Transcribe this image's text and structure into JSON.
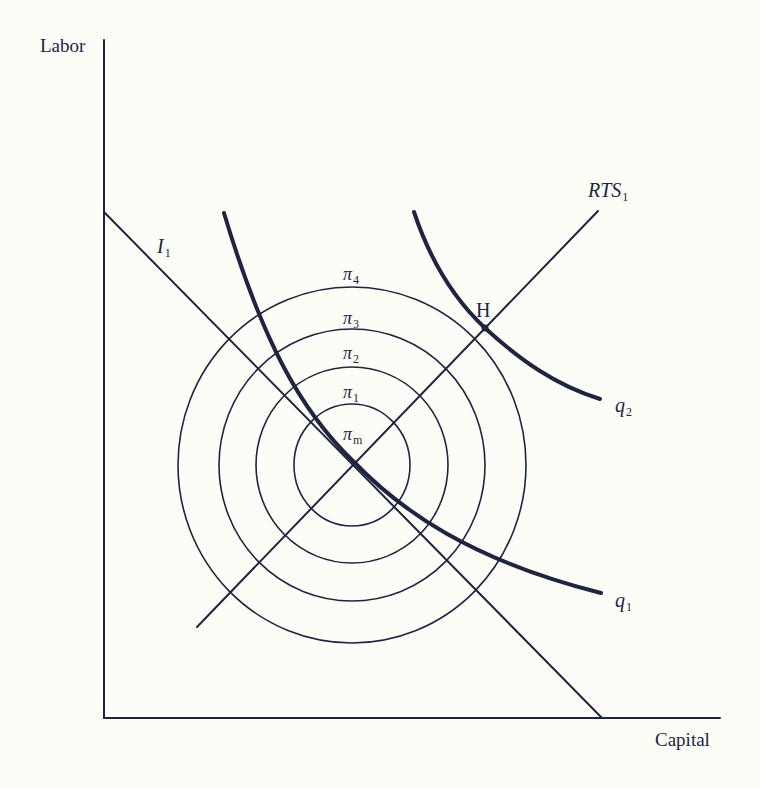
{
  "diagram": {
    "type": "economics-isoquant-isoprofit",
    "axes": {
      "x_label": "Capital",
      "y_label": "Labor"
    },
    "lines": {
      "isocost": {
        "name": "I",
        "sub": "1"
      },
      "ray": {
        "name": "RTS",
        "sub": "1"
      }
    },
    "isoquants": [
      {
        "name": "q",
        "sub": "1"
      },
      {
        "name": "q",
        "sub": "2"
      }
    ],
    "isoprofit_contours": [
      {
        "name": "π",
        "sub": "4"
      },
      {
        "name": "π",
        "sub": "3"
      },
      {
        "name": "π",
        "sub": "2"
      },
      {
        "name": "π",
        "sub": "1"
      },
      {
        "name": "π",
        "sub": "m"
      }
    ],
    "points": [
      {
        "label": "H"
      }
    ],
    "colors": {
      "ink": "#1f2440",
      "background": "#fdfdf8"
    }
  }
}
